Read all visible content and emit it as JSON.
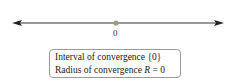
{
  "diagram": {
    "axis": {
      "tick_label": "0",
      "point_color": "#999999",
      "line_color": "#333333"
    },
    "box": {
      "line1_prefix": "Interval of convergence ",
      "line1_value": "{0}",
      "line2_prefix": "Radius of convergence ",
      "line2_var": "R",
      "line2_suffix": " = 0"
    }
  }
}
